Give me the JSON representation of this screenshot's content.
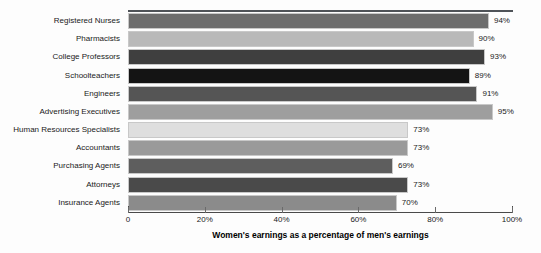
{
  "chart_data": {
    "type": "bar",
    "orientation": "horizontal",
    "title": "",
    "xlabel": "Women's earnings as a percentage of men's earnings",
    "ylabel": "",
    "xlim": [
      0,
      100
    ],
    "grid": false,
    "legend": false,
    "xticks": [
      "0",
      "20%",
      "40%",
      "60%",
      "80%",
      "100%"
    ],
    "xtick_values": [
      0,
      20,
      40,
      60,
      80,
      100
    ],
    "categories": [
      "Registered Nurses",
      "Pharmacists",
      "College Professors",
      "Schoolteachers",
      "Engineers",
      "Advertising Executives",
      "Human Resources Specialists",
      "Accountants",
      "Purchasing Agents",
      "Attorneys",
      "Insurance Agents"
    ],
    "values": [
      94,
      90,
      93,
      89,
      91,
      95,
      73,
      73,
      69,
      73,
      70
    ],
    "data_labels": [
      "94%",
      "90%",
      "93%",
      "89%",
      "91%",
      "95%",
      "73%",
      "73%",
      "69%",
      "73%",
      "70%"
    ],
    "bar_colors": [
      "#6d6d6d",
      "#b9b9b9",
      "#3f3f3f",
      "#141414",
      "#555555",
      "#9e9e9e",
      "#dedede",
      "#9a9a9a",
      "#5e5e5e",
      "#4a4a4a",
      "#8b8b8b"
    ]
  }
}
